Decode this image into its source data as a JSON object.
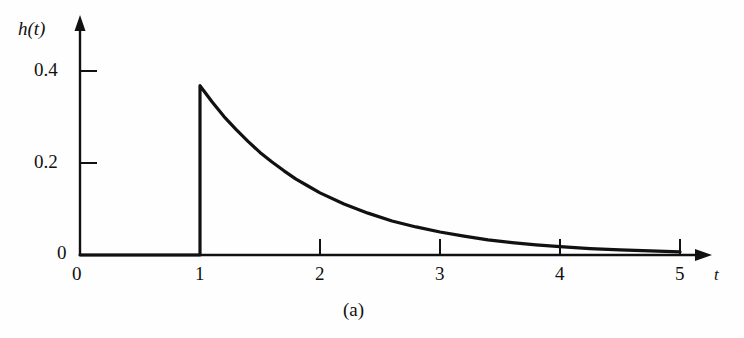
{
  "figure": {
    "caption": "(a)",
    "background_color": "#fefefe",
    "ink_color": "#111111"
  },
  "axes": {
    "y_axis_name": "h(t)",
    "x_axis_name": "t",
    "y_ticks": [
      "0",
      "0.2",
      "0.4"
    ],
    "x_ticks": [
      "0",
      "1",
      "2",
      "3",
      "4",
      "5"
    ],
    "origin_label": "0"
  },
  "chart_data": {
    "type": "line",
    "title": "",
    "subtitle": "",
    "xlabel": "t",
    "ylabel": "h(t)",
    "xlim": [
      0,
      5
    ],
    "ylim": [
      0,
      0.45
    ],
    "xticks": [
      0,
      1,
      2,
      3,
      4,
      5
    ],
    "yticks": [
      0,
      0.2,
      0.4
    ],
    "grid": false,
    "legend": null,
    "annotations": [
      "(a)"
    ],
    "series": [
      {
        "name": "h(t)",
        "color": "#111111",
        "x": [
          0,
          0.25,
          0.5,
          0.75,
          1.0,
          1.0,
          1.1,
          1.2,
          1.3,
          1.4,
          1.5,
          1.6,
          1.7,
          1.8,
          1.9,
          2.0,
          2.2,
          2.4,
          2.6,
          2.8,
          3.0,
          3.2,
          3.4,
          3.6,
          3.8,
          4.0,
          4.25,
          4.5,
          4.75,
          5.0
        ],
        "y": [
          0,
          0,
          0,
          0,
          0,
          0.368,
          0.333,
          0.301,
          0.273,
          0.247,
          0.223,
          0.202,
          0.183,
          0.165,
          0.15,
          0.135,
          0.111,
          0.091,
          0.074,
          0.061,
          0.05,
          0.041,
          0.033,
          0.027,
          0.022,
          0.018,
          0.014,
          0.011,
          0.009,
          0.007
        ]
      }
    ]
  }
}
